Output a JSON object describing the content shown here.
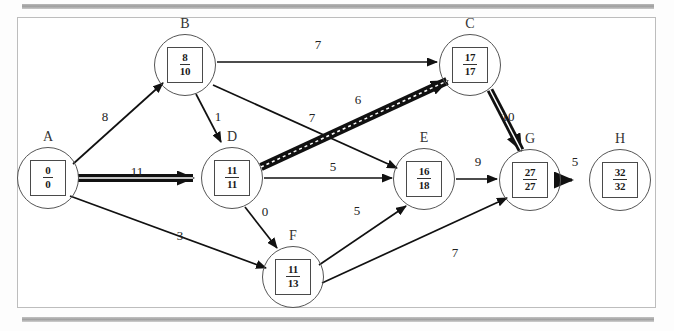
{
  "diagram": {
    "type": "pert-cpm-network",
    "title": "",
    "nodes": [
      {
        "id": "A",
        "label": "A",
        "early": "0",
        "late": "0",
        "x": 48,
        "y": 178,
        "critical": true
      },
      {
        "id": "B",
        "label": "B",
        "early": "8",
        "late": "10",
        "x": 185,
        "y": 65,
        "critical": false
      },
      {
        "id": "C",
        "label": "C",
        "early": "17",
        "late": "17",
        "x": 470,
        "y": 65,
        "critical": true
      },
      {
        "id": "D",
        "label": "D",
        "early": "11",
        "late": "11",
        "x": 232,
        "y": 178,
        "critical": true
      },
      {
        "id": "E",
        "label": "E",
        "early": "16",
        "late": "18",
        "x": 424,
        "y": 179,
        "critical": false
      },
      {
        "id": "F",
        "label": "F",
        "early": "11",
        "late": "13",
        "x": 293,
        "y": 277,
        "critical": false
      },
      {
        "id": "G",
        "label": "G",
        "early": "27",
        "late": "27",
        "x": 530,
        "y": 180,
        "critical": true
      },
      {
        "id": "H",
        "label": "H",
        "early": "32",
        "late": "32",
        "x": 620,
        "y": 180,
        "critical": true
      }
    ],
    "edges": [
      {
        "from": "A",
        "to": "B",
        "weight": "8",
        "critical": false,
        "lx": 105,
        "ly": 117
      },
      {
        "from": "A",
        "to": "D",
        "weight": "11",
        "critical": true,
        "lx": 137,
        "ly": 172
      },
      {
        "from": "A",
        "to": "F",
        "weight": "3",
        "critical": false,
        "lx": 180,
        "ly": 236
      },
      {
        "from": "B",
        "to": "C",
        "weight": "7",
        "critical": false,
        "lx": 318,
        "ly": 45
      },
      {
        "from": "B",
        "to": "D",
        "weight": "1",
        "critical": false,
        "lx": 218,
        "ly": 117
      },
      {
        "from": "B",
        "to": "E",
        "weight": "7",
        "critical": false,
        "lx": 312,
        "ly": 118
      },
      {
        "from": "D",
        "to": "C",
        "weight": "6",
        "critical": true,
        "lx": 358,
        "ly": 100
      },
      {
        "from": "D",
        "to": "E",
        "weight": "5",
        "critical": false,
        "lx": 333,
        "ly": 167
      },
      {
        "from": "D",
        "to": "F",
        "weight": "0",
        "critical": false,
        "lx": 265,
        "ly": 212
      },
      {
        "from": "C",
        "to": "G",
        "weight": "10",
        "critical": true,
        "lx": 508,
        "ly": 117
      },
      {
        "from": "E",
        "to": "G",
        "weight": "9",
        "critical": false,
        "lx": 478,
        "ly": 162
      },
      {
        "from": "F",
        "to": "E",
        "weight": "5",
        "critical": false,
        "lx": 357,
        "ly": 211
      },
      {
        "from": "F",
        "to": "G",
        "weight": "7",
        "critical": false,
        "lx": 455,
        "ly": 253
      },
      {
        "from": "G",
        "to": "H",
        "weight": "5",
        "critical": true,
        "lx": 575,
        "ly": 162
      }
    ],
    "colors": {
      "ink": "#1a1a1a",
      "page": "#ffffff",
      "border": "#bdbdbd",
      "scanbar": "#a9a9a9"
    }
  }
}
